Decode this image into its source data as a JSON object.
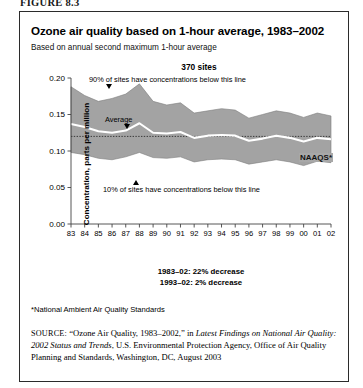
{
  "figure": {
    "label": "FIGURE 8.3"
  },
  "chart": {
    "title": "Ozone air quality based on 1-hour average, 1983–2002",
    "subtitle": "Based on annual second maximum 1-hour average",
    "sites_header": "370 sites",
    "y_axis_title": "Concentration, parts per million",
    "naaqs_label": "NAAQS*",
    "annotations": {
      "p90": "90% of sites have concentrations below this line",
      "average": "Average",
      "p10": "10% of sites have concentrations below this line"
    },
    "decrease_lines": [
      "1983–02: 22% decrease",
      "1993–02: 2% decrease"
    ],
    "footnote": "*National Ambient Air Quality Standards",
    "band_color": "#a3a3a3",
    "average_line_color": "#ffffff",
    "naaqs_line_color": "#3a3a3a"
  },
  "source": {
    "prefix": "SOURCE:",
    "part1": " “Ozone Air Quality, 1983–2002,” in ",
    "italic": "Latest Findings on National Air Quality: 2002 Status and Trends",
    "part2": ", U.S. Environmental Protection Agency, Office of Air Quality Planning and Standards, Washington, DC, August 2003"
  },
  "chart_data": {
    "type": "area",
    "title": "Ozone air quality based on 1-hour average, 1983–2002",
    "subtitle": "Based on annual second maximum 1-hour average",
    "xlabel": "",
    "ylabel": "Concentration, parts per million",
    "ylim": [
      0.0,
      0.2
    ],
    "yticks": [
      0.0,
      0.05,
      0.1,
      0.15,
      0.2
    ],
    "ytick_labels": [
      "0.00",
      "0.05",
      "0.10",
      "0.15",
      "0.20"
    ],
    "grid": false,
    "legend": "annotated inline",
    "x": [
      1983,
      1984,
      1985,
      1986,
      1987,
      1988,
      1989,
      1990,
      1991,
      1992,
      1993,
      1994,
      1995,
      1996,
      1997,
      1998,
      1999,
      2000,
      2001,
      2002
    ],
    "xtick_labels": [
      "83",
      "84",
      "85",
      "86",
      "87",
      "88",
      "89",
      "90",
      "91",
      "92",
      "93",
      "94",
      "95",
      "96",
      "97",
      "98",
      "99",
      "00",
      "01",
      "02"
    ],
    "series": [
      {
        "name": "90% of sites have concentrations below this line",
        "values": [
          0.188,
          0.176,
          0.168,
          0.172,
          0.178,
          0.192,
          0.168,
          0.163,
          0.166,
          0.152,
          0.155,
          0.158,
          0.156,
          0.145,
          0.15,
          0.155,
          0.152,
          0.146,
          0.152,
          0.148
        ]
      },
      {
        "name": "Average",
        "values": [
          0.137,
          0.133,
          0.127,
          0.125,
          0.128,
          0.138,
          0.125,
          0.124,
          0.126,
          0.118,
          0.121,
          0.122,
          0.121,
          0.114,
          0.117,
          0.121,
          0.118,
          0.113,
          0.118,
          0.116
        ]
      },
      {
        "name": "10% of sites have concentrations below this line",
        "values": [
          0.098,
          0.095,
          0.09,
          0.088,
          0.092,
          0.098,
          0.091,
          0.09,
          0.092,
          0.085,
          0.088,
          0.089,
          0.088,
          0.082,
          0.085,
          0.088,
          0.085,
          0.08,
          0.086,
          0.084
        ]
      }
    ],
    "reference_line": {
      "label": "NAAQS*",
      "value": 0.12,
      "style": "dotted"
    },
    "annotations": [
      "1983–02: 22% decrease",
      "1993–02: 2% decrease"
    ]
  }
}
